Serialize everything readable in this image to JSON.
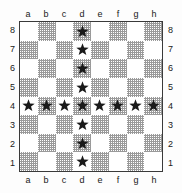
{
  "diagram": {
    "marker_icon": "star-icon"
  },
  "colors": {
    "light_square": "#ffffff",
    "dark_square": "#9a9a9a",
    "border": "#3a3a3a",
    "marker": "#1a1a1a",
    "label_text": "#202020",
    "background": "#fdfdfd"
  },
  "coordinates": {
    "files_top": [
      "a",
      "b",
      "c",
      "d",
      "e",
      "f",
      "g",
      "h"
    ],
    "files_bottom": [
      "a",
      "b",
      "c",
      "d",
      "e",
      "f",
      "g",
      "h"
    ],
    "ranks_left": [
      "8",
      "7",
      "6",
      "5",
      "4",
      "3",
      "2",
      "1"
    ],
    "ranks_right": [
      "8",
      "7",
      "6",
      "5",
      "4",
      "3",
      "2",
      "1"
    ]
  },
  "chart_data": {
    "type": "heatmap",
    "xlabel": "file",
    "ylabel": "rank",
    "grid": true,
    "legend": "none",
    "categories": [
      "a",
      "b",
      "c",
      "d",
      "e",
      "f",
      "g",
      "h"
    ],
    "rows": [
      "8",
      "7",
      "6",
      "5",
      "4",
      "3",
      "2",
      "1"
    ],
    "marked_squares": [
      "d8",
      "d7",
      "d6",
      "d5",
      "a4",
      "b4",
      "c4",
      "d4",
      "e4",
      "f4",
      "g4",
      "h4",
      "d3",
      "d2",
      "d1"
    ],
    "marked_count": 15,
    "board": [
      {
        "rank": "8",
        "squares": [
          {
            "id": "a8",
            "shade": "light",
            "marked": false
          },
          {
            "id": "b8",
            "shade": "dark",
            "marked": false
          },
          {
            "id": "c8",
            "shade": "light",
            "marked": false
          },
          {
            "id": "d8",
            "shade": "dark",
            "marked": true
          },
          {
            "id": "e8",
            "shade": "light",
            "marked": false
          },
          {
            "id": "f8",
            "shade": "dark",
            "marked": false
          },
          {
            "id": "g8",
            "shade": "light",
            "marked": false
          },
          {
            "id": "h8",
            "shade": "dark",
            "marked": false
          }
        ]
      },
      {
        "rank": "7",
        "squares": [
          {
            "id": "a7",
            "shade": "dark",
            "marked": false
          },
          {
            "id": "b7",
            "shade": "light",
            "marked": false
          },
          {
            "id": "c7",
            "shade": "dark",
            "marked": false
          },
          {
            "id": "d7",
            "shade": "light",
            "marked": true
          },
          {
            "id": "e7",
            "shade": "dark",
            "marked": false
          },
          {
            "id": "f7",
            "shade": "light",
            "marked": false
          },
          {
            "id": "g7",
            "shade": "dark",
            "marked": false
          },
          {
            "id": "h7",
            "shade": "light",
            "marked": false
          }
        ]
      },
      {
        "rank": "6",
        "squares": [
          {
            "id": "a6",
            "shade": "light",
            "marked": false
          },
          {
            "id": "b6",
            "shade": "dark",
            "marked": false
          },
          {
            "id": "c6",
            "shade": "light",
            "marked": false
          },
          {
            "id": "d6",
            "shade": "dark",
            "marked": true
          },
          {
            "id": "e6",
            "shade": "light",
            "marked": false
          },
          {
            "id": "f6",
            "shade": "dark",
            "marked": false
          },
          {
            "id": "g6",
            "shade": "light",
            "marked": false
          },
          {
            "id": "h6",
            "shade": "dark",
            "marked": false
          }
        ]
      },
      {
        "rank": "5",
        "squares": [
          {
            "id": "a5",
            "shade": "dark",
            "marked": false
          },
          {
            "id": "b5",
            "shade": "light",
            "marked": false
          },
          {
            "id": "c5",
            "shade": "dark",
            "marked": false
          },
          {
            "id": "d5",
            "shade": "light",
            "marked": true
          },
          {
            "id": "e5",
            "shade": "dark",
            "marked": false
          },
          {
            "id": "f5",
            "shade": "light",
            "marked": false
          },
          {
            "id": "g5",
            "shade": "dark",
            "marked": false
          },
          {
            "id": "h5",
            "shade": "light",
            "marked": false
          }
        ]
      },
      {
        "rank": "4",
        "squares": [
          {
            "id": "a4",
            "shade": "light",
            "marked": true
          },
          {
            "id": "b4",
            "shade": "dark",
            "marked": true
          },
          {
            "id": "c4",
            "shade": "light",
            "marked": true
          },
          {
            "id": "d4",
            "shade": "dark",
            "marked": true
          },
          {
            "id": "e4",
            "shade": "light",
            "marked": true
          },
          {
            "id": "f4",
            "shade": "dark",
            "marked": true
          },
          {
            "id": "g4",
            "shade": "light",
            "marked": true
          },
          {
            "id": "h4",
            "shade": "dark",
            "marked": true
          }
        ]
      },
      {
        "rank": "3",
        "squares": [
          {
            "id": "a3",
            "shade": "dark",
            "marked": false
          },
          {
            "id": "b3",
            "shade": "light",
            "marked": false
          },
          {
            "id": "c3",
            "shade": "dark",
            "marked": false
          },
          {
            "id": "d3",
            "shade": "light",
            "marked": true
          },
          {
            "id": "e3",
            "shade": "dark",
            "marked": false
          },
          {
            "id": "f3",
            "shade": "light",
            "marked": false
          },
          {
            "id": "g3",
            "shade": "dark",
            "marked": false
          },
          {
            "id": "h3",
            "shade": "light",
            "marked": false
          }
        ]
      },
      {
        "rank": "2",
        "squares": [
          {
            "id": "a2",
            "shade": "light",
            "marked": false
          },
          {
            "id": "b2",
            "shade": "dark",
            "marked": false
          },
          {
            "id": "c2",
            "shade": "light",
            "marked": false
          },
          {
            "id": "d2",
            "shade": "dark",
            "marked": true
          },
          {
            "id": "e2",
            "shade": "light",
            "marked": false
          },
          {
            "id": "f2",
            "shade": "dark",
            "marked": false
          },
          {
            "id": "g2",
            "shade": "light",
            "marked": false
          },
          {
            "id": "h2",
            "shade": "dark",
            "marked": false
          }
        ]
      },
      {
        "rank": "1",
        "squares": [
          {
            "id": "a1",
            "shade": "dark",
            "marked": false
          },
          {
            "id": "b1",
            "shade": "light",
            "marked": false
          },
          {
            "id": "c1",
            "shade": "dark",
            "marked": false
          },
          {
            "id": "d1",
            "shade": "light",
            "marked": true
          },
          {
            "id": "e1",
            "shade": "dark",
            "marked": false
          },
          {
            "id": "f1",
            "shade": "light",
            "marked": false
          },
          {
            "id": "g1",
            "shade": "dark",
            "marked": false
          },
          {
            "id": "h1",
            "shade": "light",
            "marked": false
          }
        ]
      }
    ]
  }
}
